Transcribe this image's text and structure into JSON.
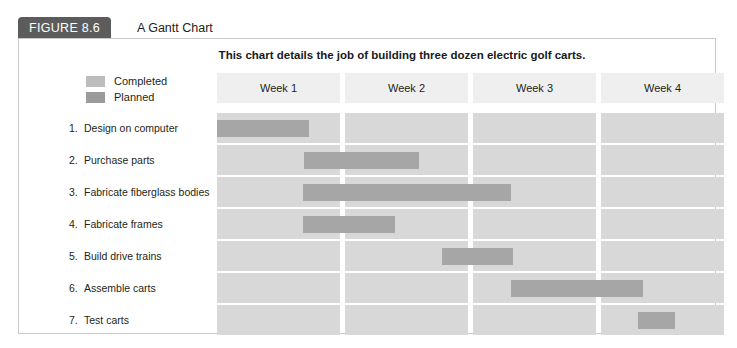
{
  "figure": {
    "badge": "FIGURE 8.6",
    "title": "A Gantt Chart"
  },
  "chart_data": {
    "type": "bar",
    "title": "This chart details the job of building three dozen electric golf carts.",
    "xlabel": "",
    "ylabel": "",
    "categories": [
      "Week 1",
      "Week 2",
      "Week 3",
      "Week 4"
    ],
    "xlim": [
      0,
      4
    ],
    "grid": true,
    "legend": [
      {
        "label": "Completed",
        "color": "#bdbdbd"
      },
      {
        "label": "Planned",
        "color": "#9b9b9b"
      }
    ],
    "bar_color": "#a6a6a6",
    "track_color": "#d8d8d8",
    "tasks": [
      {
        "num": "1.",
        "name": "Design on computer",
        "start": 0.0,
        "end": 0.72
      },
      {
        "num": "2.",
        "name": "Purchase parts",
        "start": 0.68,
        "end": 1.58
      },
      {
        "num": "3.",
        "name": "Fabricate fiberglass bodies",
        "start": 0.67,
        "end": 2.3
      },
      {
        "num": "4.",
        "name": "Fabricate frames",
        "start": 0.67,
        "end": 1.39
      },
      {
        "num": "5.",
        "name": "Build drive trains",
        "start": 1.76,
        "end": 2.31
      },
      {
        "num": "6.",
        "name": "Assemble carts",
        "start": 2.3,
        "end": 3.33
      },
      {
        "num": "7.",
        "name": "Test carts",
        "start": 3.29,
        "end": 3.58
      }
    ]
  }
}
